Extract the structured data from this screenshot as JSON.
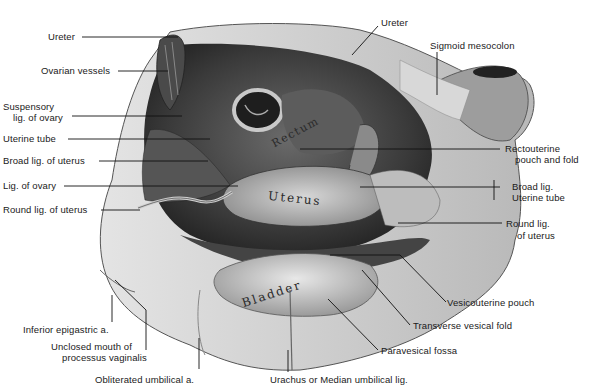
{
  "figure": {
    "colors": {
      "background": "#ffffff",
      "label_text": "#1a1a1a",
      "leader_line": "#111111"
    },
    "organ_labels": [
      {
        "text": "Rectum"
      },
      {
        "text": "Uterus"
      },
      {
        "text": "Bladder"
      }
    ],
    "labels_left": [
      {
        "id": "ureter-left",
        "text": "Ureter"
      },
      {
        "id": "ovarian-vessels",
        "text": "Ovarian vessels"
      },
      {
        "id": "suspensory-lig",
        "line1": "Suspensory",
        "line2": "lig. of ovary"
      },
      {
        "id": "uterine-tube",
        "text": "Uterine tube"
      },
      {
        "id": "broad-lig-uterus",
        "text": "Broad lig. of uterus"
      },
      {
        "id": "lig-of-ovary",
        "text": "Lig. of ovary"
      },
      {
        "id": "round-lig-left",
        "text": "Round lig. of uterus"
      }
    ],
    "labels_right": [
      {
        "id": "ureter-right",
        "text": "Ureter"
      },
      {
        "id": "sigmoid-mesocolon",
        "text": "Sigmoid mesocolon"
      },
      {
        "id": "rectouterine",
        "line1": "Rectouterine",
        "line2": "pouch and fold"
      },
      {
        "id": "broad-lig-tube",
        "line1": "Broad lig.",
        "line2": "Uterine tube"
      },
      {
        "id": "round-lig-right",
        "line1": "Round lig.",
        "line2": "of uterus"
      },
      {
        "id": "vesicouterine",
        "text": "Vesicouterine pouch"
      },
      {
        "id": "transverse-vesical",
        "text": "Transverse vesical fold"
      },
      {
        "id": "paravesical",
        "text": "Paravesical fossa"
      }
    ],
    "labels_bottom": [
      {
        "id": "inferior-epigastric",
        "text": "Inferior epigastric a."
      },
      {
        "id": "unclosed-mouth",
        "line1": "Unclosed mouth of",
        "line2": "processus vaginalis"
      },
      {
        "id": "obliterated-umbilical",
        "text": "Obliterated umbilical a."
      },
      {
        "id": "urachus",
        "text": "Urachus or Median umbilical lig."
      }
    ]
  }
}
